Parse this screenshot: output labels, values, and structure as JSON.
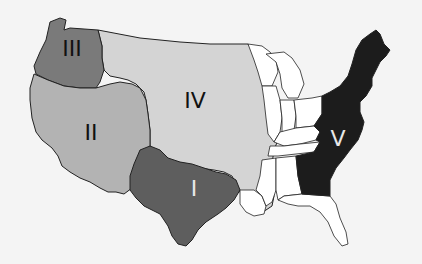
{
  "map": {
    "title": "United States regions",
    "regions": [
      {
        "id": "I",
        "label": "I",
        "area": "Texas",
        "fill": "#5e5e5e",
        "label_color": "#e8e8e8"
      },
      {
        "id": "II",
        "label": "II",
        "area": "California / Nevada / Utah / Arizona (Mexican Cession)",
        "fill": "#b3b3b3",
        "label_color": "#111111"
      },
      {
        "id": "III",
        "label": "III",
        "area": "Oregon Country (Washington / Oregon)",
        "fill": "#7a7a7a",
        "label_color": "#111111"
      },
      {
        "id": "IV",
        "label": "IV",
        "area": "Louisiana Purchase",
        "fill": "#d4d4d4",
        "label_color": "#111111"
      },
      {
        "id": "V",
        "label": "V",
        "area": "Original Thirteen Colonies / Eastern Seaboard",
        "fill": "#1c1c1c",
        "label_color": "#e8e8e8"
      }
    ],
    "other_states_fill": "#ffffff",
    "background": "#f4f4f4"
  }
}
